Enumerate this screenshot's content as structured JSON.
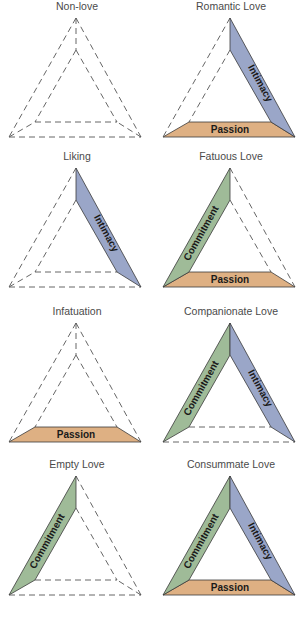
{
  "diagram": {
    "type": "sternberg-triangular-theory-of-love",
    "components": {
      "intimacy": {
        "label": "Intimacy",
        "color": "#9aa6c8",
        "side": "right"
      },
      "passion": {
        "label": "Passion",
        "color": "#deb083",
        "side": "base"
      },
      "commitment": {
        "label": "Commitment",
        "color": "#9fbb98",
        "side": "left"
      }
    },
    "panels": [
      {
        "title": "Non-love",
        "intimacy": false,
        "passion": false,
        "commitment": false
      },
      {
        "title": "Romantic Love",
        "intimacy": true,
        "passion": true,
        "commitment": false
      },
      {
        "title": "Liking",
        "intimacy": true,
        "passion": false,
        "commitment": false
      },
      {
        "title": "Fatuous Love",
        "intimacy": false,
        "passion": true,
        "commitment": true
      },
      {
        "title": "Infatuation",
        "intimacy": false,
        "passion": true,
        "commitment": false
      },
      {
        "title": "Companionate Love",
        "intimacy": true,
        "passion": false,
        "commitment": true
      },
      {
        "title": "Empty Love",
        "intimacy": false,
        "passion": false,
        "commitment": true
      },
      {
        "title": "Consummate Love",
        "intimacy": true,
        "passion": true,
        "commitment": true
      }
    ]
  }
}
